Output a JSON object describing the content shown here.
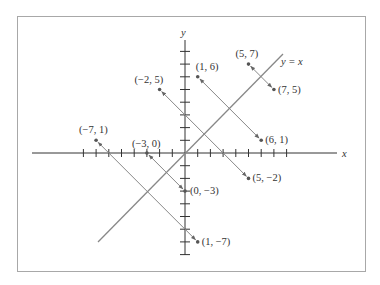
{
  "diagram": {
    "title": "",
    "axes": {
      "x_label": "x",
      "y_label": "y",
      "x_ticks": [
        -8,
        -7,
        -6,
        -5,
        -4,
        -3,
        -2,
        -1,
        1,
        2,
        3,
        4,
        5,
        6,
        7,
        8
      ],
      "y_ticks": [
        -8,
        -7,
        -6,
        -5,
        -4,
        -3,
        -2,
        -1,
        1,
        2,
        3,
        4,
        5,
        6,
        7,
        8
      ]
    },
    "line": {
      "label": "y = x",
      "color": "#888888"
    },
    "reflection_pairs": [
      {
        "from": {
          "x": 5,
          "y": 7,
          "label": "(5, 7)"
        },
        "to": {
          "x": 7,
          "y": 5,
          "label": "(7, 5)"
        }
      },
      {
        "from": {
          "x": 1,
          "y": 6,
          "label": "(1, 6)"
        },
        "to": {
          "x": 6,
          "y": 1,
          "label": "(6, 1)"
        }
      },
      {
        "from": {
          "x": -2,
          "y": 5,
          "label": "(−2, 5)"
        },
        "to": {
          "x": 5,
          "y": -2,
          "label": "(5, −2)"
        }
      },
      {
        "from": {
          "x": -7,
          "y": 1,
          "label": "(−7, 1)"
        },
        "to": {
          "x": 1,
          "y": -7,
          "label": "(1, −7)"
        }
      },
      {
        "from": {
          "x": -3,
          "y": 0,
          "label": "(−3, 0)"
        },
        "to": {
          "x": 0,
          "y": -3,
          "label": "(0, −3)"
        }
      }
    ],
    "colors": {
      "axis": "#333333",
      "segment": "#888888",
      "point": "#555555",
      "frame": "#a8a8a8"
    }
  }
}
